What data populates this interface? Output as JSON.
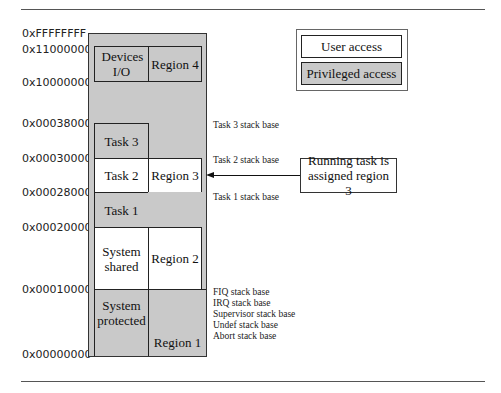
{
  "diagram": {
    "type": "memory-map-mpu-regions",
    "address_labels": [
      {
        "text": "0xFFFFFFFF",
        "y": 28
      },
      {
        "text": "0x11000000",
        "y": 44
      },
      {
        "text": "0x10000000",
        "y": 77
      },
      {
        "text": "0x00038000",
        "y": 118
      },
      {
        "text": "0x00030000",
        "y": 153
      },
      {
        "text": "0x00028000",
        "y": 187
      },
      {
        "text": "0x00020000",
        "y": 222
      },
      {
        "text": "0x00010000",
        "y": 284
      },
      {
        "text": "0x00000000",
        "y": 349
      }
    ],
    "cells": {
      "devices_io": "Devices I/O",
      "region_4": "Region 4",
      "task_3": "Task 3",
      "task_2": "Task 2",
      "region_3": "Region 3",
      "task_1": "Task 1",
      "system_shared": "System shared",
      "region_2": "Region 2",
      "system_protected": "System protected",
      "region_1": "Region 1"
    },
    "stack_notes": {
      "task3": "Task 3 stack base",
      "task2": "Task 2 stack base",
      "task1": "Task 1 stack base",
      "fiq": "FIQ stack base",
      "irq": "IRQ stack base",
      "supervisor": "Supervisor stack base",
      "undef": "Undef stack base",
      "abort": "Abort stack base"
    },
    "legend": {
      "user": "User access",
      "privileged": "Privileged access"
    },
    "callout": "Running task is assigned region 3",
    "colors": {
      "privileged_fill": "#c9c9c9",
      "user_fill": "#ffffff",
      "border": "#222222"
    }
  }
}
